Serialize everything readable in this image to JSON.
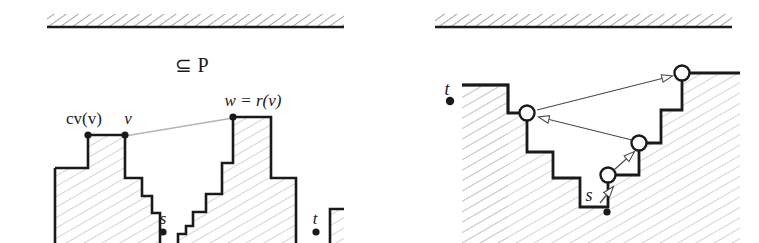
{
  "figure": {
    "caption_text": "⊆ P",
    "background_color": "#ffffff",
    "ink_color": "#1a1a1a",
    "hatch_color": "#c9c9c9",
    "thin_line_color": "#555555"
  },
  "left_panel": {
    "name": "left-panel",
    "ceiling_label": "",
    "labels": {
      "subset_p": "⊆ P",
      "cv_v": "cv(v)",
      "v": "v",
      "w_eq_rv": "w = r(v)",
      "s": "s",
      "t": "t"
    },
    "vertices": {
      "cv_v": {
        "x": 88,
        "y": 135
      },
      "v": {
        "x": 125,
        "y": 135
      },
      "w": {
        "x": 233,
        "y": 117
      },
      "s": {
        "x": 163,
        "y": 232
      },
      "t": {
        "x": 316,
        "y": 232
      }
    },
    "sight_line": {
      "from_x": 125,
      "from_y": 136,
      "to_x": 233,
      "to_y": 118
    }
  },
  "right_panel": {
    "name": "right-panel",
    "labels": {
      "s": "s",
      "t": "t"
    },
    "vertices": {
      "t": {
        "x": 450,
        "y": 101
      },
      "s": {
        "x": 607,
        "y": 213
      },
      "node_left": {
        "x": 527,
        "y": 113
      },
      "node_mid": {
        "x": 639,
        "y": 143
      },
      "node_low": {
        "x": 608,
        "y": 175
      },
      "node_right": {
        "x": 682,
        "y": 73
      }
    },
    "arrows": [
      {
        "name": "arrow-s-to-node-low",
        "from_x": 598,
        "from_y": 202,
        "to_x": 612,
        "to_y": 186
      },
      {
        "name": "arrow-node-low-to-node-mid",
        "from_x": 615,
        "from_y": 170,
        "to_x": 634,
        "to_y": 152
      },
      {
        "name": "arrow-node-mid-to-node-left",
        "from_x": 632,
        "from_y": 140,
        "to_x": 538,
        "to_y": 117
      },
      {
        "name": "arrow-node-left-to-node-right",
        "from_x": 538,
        "from_y": 110,
        "to_x": 674,
        "to_y": 76
      }
    ]
  }
}
